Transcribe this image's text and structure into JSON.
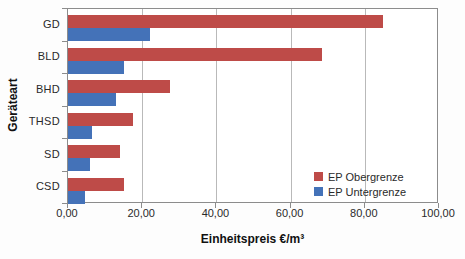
{
  "chart_data": {
    "type": "bar",
    "orientation": "horizontal",
    "title": "",
    "xlabel": "Einheitspreis €/m³",
    "ylabel": "Geräteart",
    "categories": [
      "GD",
      "BLD",
      "BHD",
      "THSD",
      "SD",
      "CSD"
    ],
    "series": [
      {
        "name": "EP Obergrenze",
        "color": "#BE4B48",
        "values": [
          85,
          68.5,
          27.5,
          17.5,
          14,
          15
        ]
      },
      {
        "name": "EP Untergrenze",
        "color": "#4472B8",
        "values": [
          22,
          15,
          13,
          6.5,
          6,
          4.5
        ]
      }
    ],
    "xlim": [
      0,
      100
    ],
    "xticks": [
      0,
      20,
      40,
      60,
      80,
      100
    ],
    "xtick_labels": [
      "0,00",
      "20,00",
      "40,00",
      "60,00",
      "80,00",
      "100,00"
    ],
    "grid": "vertical-gridlines",
    "legend_position": "inside-bottom-right"
  },
  "colors": {
    "plot_border": "#8c8c8c",
    "gridline": "#b9b9b9",
    "background": "#ffffff"
  }
}
